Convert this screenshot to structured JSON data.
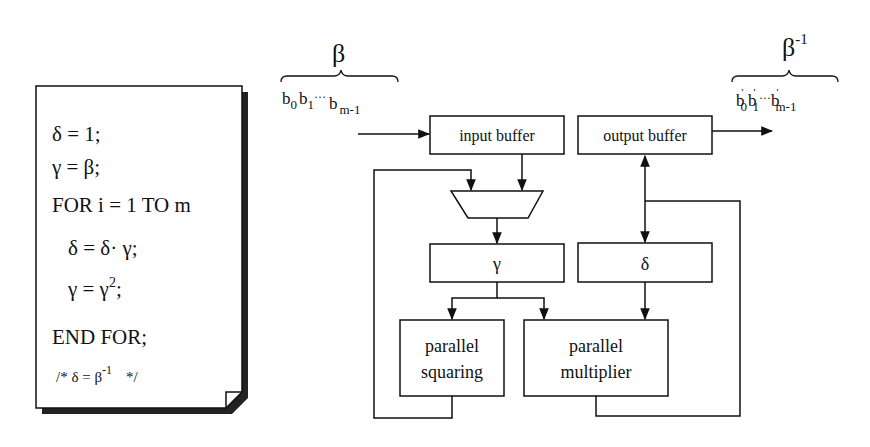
{
  "algorithm": {
    "lines": [
      "δ = 1;",
      "γ = β;",
      "FOR i = 1 TO m",
      "δ = δ· γ;",
      "γ = γ",
      "END FOR;"
    ],
    "line5_superscript": "2",
    "line5_suffix": ";",
    "comment_prefix": "/*  δ = β",
    "comment_superscript": "-1",
    "comment_suffix": "*/"
  },
  "input": {
    "symbol": "β",
    "bits": {
      "b0": "b",
      "b0_sub": "0",
      "b1": "b",
      "b1_sub": "1",
      "dots": "···",
      "bm": "b",
      "bm_sub": "m-1"
    }
  },
  "output": {
    "symbol": "β",
    "symbol_superscript": "-1",
    "bits": {
      "b0": "b",
      "b0_sub": "0",
      "b1": "b",
      "b1_sub": "1",
      "dots": "···",
      "bm": "b",
      "bm_sub": "m-1",
      "prime": "'"
    }
  },
  "blocks": {
    "input_buffer": "input buffer",
    "output_buffer": "output buffer",
    "gamma_register": "γ",
    "delta_register": "δ",
    "squaring": [
      "parallel",
      "squaring"
    ],
    "multiplier": [
      "parallel",
      "multiplier"
    ]
  }
}
